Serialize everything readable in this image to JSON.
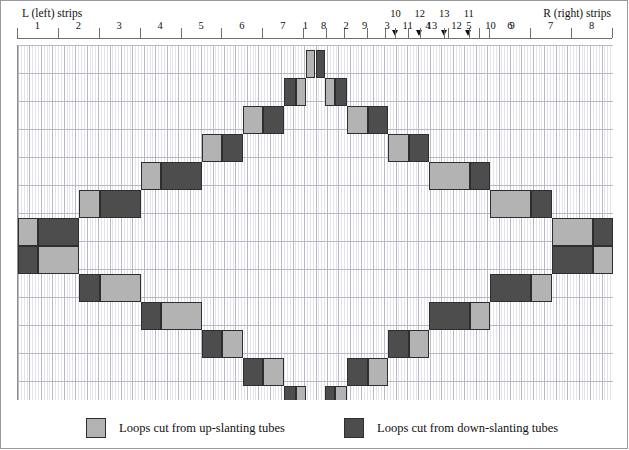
{
  "header": {
    "left_label": "L (left) strips",
    "right_label": "R (right) strips"
  },
  "colors": {
    "up_slanting": "#b3b3b3",
    "down_slanting": "#4d4d4d",
    "grid_minor": "#e3e3ec",
    "grid_major": "#b9b9c6",
    "frame": "#9a9a9a",
    "block_border": "#2e2e2e",
    "background": "#ffffff"
  },
  "legend": {
    "up": {
      "label": "Loops cut from up-slanting tubes",
      "swatch": "#b3b3b3"
    },
    "down": {
      "label": "Loops cut from down-slanting tubes",
      "swatch": "#4d4d4d"
    }
  },
  "ruler": {
    "left_numbers": [
      "1",
      "2",
      "3",
      "4",
      "5",
      "6",
      "7",
      "8",
      "9"
    ],
    "left_inner_upper": [
      "10",
      "12",
      "13",
      "11"
    ],
    "left_inner_lower": [
      "11",
      "13",
      "12"
    ],
    "right_inner_lower": [
      "10",
      "9"
    ],
    "right_numbers": [
      "8",
      "7",
      "6",
      "5",
      "4",
      "3",
      "2",
      "1"
    ],
    "arrow_count": 4,
    "all_labels_left_to_right": [
      "1",
      "2",
      "3",
      "4",
      "5",
      "6",
      "7",
      "8",
      "9",
      "10",
      "11",
      "12",
      "13",
      "13",
      "12",
      "11",
      "10",
      "9",
      "8",
      "7",
      "6",
      "5",
      "4",
      "3",
      "2",
      "1"
    ]
  },
  "chart_data": {
    "type": "diagram",
    "grid": {
      "columns": 52,
      "rows": 13,
      "minor_per_major": 4
    },
    "blocks": [
      {
        "x": 0,
        "y": 7,
        "w": 1,
        "c": "up"
      },
      {
        "x": 1,
        "y": 7,
        "w": 2,
        "c": "down"
      },
      {
        "x": 3,
        "y": 6,
        "w": 1,
        "c": "up"
      },
      {
        "x": 4,
        "y": 6,
        "w": 2,
        "c": "down"
      },
      {
        "x": 6,
        "y": 5,
        "w": 1,
        "c": "up"
      },
      {
        "x": 7,
        "y": 5,
        "w": 2,
        "c": "down"
      },
      {
        "x": 9,
        "y": 4,
        "w": 1,
        "c": "up"
      },
      {
        "x": 10,
        "y": 4,
        "w": 1,
        "c": "down"
      },
      {
        "x": 11,
        "y": 3,
        "w": 1,
        "c": "up"
      },
      {
        "x": 12,
        "y": 3,
        "w": 1,
        "c": "down"
      },
      {
        "x": 13,
        "y": 2,
        "w": 0.6,
        "c": "down"
      },
      {
        "x": 13.6,
        "y": 2,
        "w": 0.5,
        "c": "up"
      },
      {
        "x": 14.1,
        "y": 1,
        "w": 0.45,
        "c": "up"
      },
      {
        "x": 14.55,
        "y": 1,
        "w": 0.45,
        "c": "down"
      },
      {
        "x": 15,
        "y": 2,
        "w": 0.5,
        "c": "up"
      },
      {
        "x": 15.5,
        "y": 2,
        "w": 0.6,
        "c": "down"
      },
      {
        "x": 16.1,
        "y": 3,
        "w": 1,
        "c": "up"
      },
      {
        "x": 17.1,
        "y": 3,
        "w": 1,
        "c": "down"
      },
      {
        "x": 18.1,
        "y": 4,
        "w": 1,
        "c": "up"
      },
      {
        "x": 19.1,
        "y": 4,
        "w": 1,
        "c": "down"
      },
      {
        "x": 20.1,
        "y": 5,
        "w": 2,
        "c": "up"
      },
      {
        "x": 22.1,
        "y": 5,
        "w": 1,
        "c": "down"
      },
      {
        "x": 23.1,
        "y": 6,
        "w": 2,
        "c": "up"
      },
      {
        "x": 25.1,
        "y": 6,
        "w": 1,
        "c": "down"
      },
      {
        "x": 26.1,
        "y": 7,
        "w": 2,
        "c": "up"
      },
      {
        "x": 28.1,
        "y": 7,
        "w": 1,
        "c": "down"
      }
    ],
    "blocks_lower": [
      {
        "x": 0,
        "y": 8,
        "w": 1,
        "c": "down"
      },
      {
        "x": 1,
        "y": 8,
        "w": 2,
        "c": "up"
      },
      {
        "x": 3,
        "y": 9,
        "w": 1,
        "c": "down"
      },
      {
        "x": 4,
        "y": 9,
        "w": 2,
        "c": "up"
      },
      {
        "x": 6,
        "y": 10,
        "w": 1,
        "c": "down"
      },
      {
        "x": 7,
        "y": 10,
        "w": 2,
        "c": "up"
      },
      {
        "x": 9,
        "y": 11,
        "w": 1,
        "c": "down"
      },
      {
        "x": 10,
        "y": 11,
        "w": 1,
        "c": "up"
      },
      {
        "x": 11,
        "y": 12,
        "w": 1,
        "c": "down"
      },
      {
        "x": 12,
        "y": 12,
        "w": 1,
        "c": "up"
      },
      {
        "x": 13,
        "y": 13,
        "w": 0.6,
        "c": "down"
      },
      {
        "x": 13.6,
        "y": 13,
        "w": 0.5,
        "c": "up"
      },
      {
        "x": 14.1,
        "y": 14,
        "w": 0.45,
        "c": "down"
      },
      {
        "x": 14.55,
        "y": 14,
        "w": 0.45,
        "c": "up"
      },
      {
        "x": 15,
        "y": 13,
        "w": 0.5,
        "c": "down"
      },
      {
        "x": 15.5,
        "y": 13,
        "w": 0.6,
        "c": "up"
      },
      {
        "x": 16.1,
        "y": 12,
        "w": 1,
        "c": "down"
      },
      {
        "x": 17.1,
        "y": 12,
        "w": 1,
        "c": "up"
      },
      {
        "x": 18.1,
        "y": 11,
        "w": 1,
        "c": "down"
      },
      {
        "x": 19.1,
        "y": 11,
        "w": 1,
        "c": "up"
      },
      {
        "x": 20.1,
        "y": 10,
        "w": 2,
        "c": "down"
      },
      {
        "x": 22.1,
        "y": 10,
        "w": 1,
        "c": "up"
      },
      {
        "x": 23.1,
        "y": 9,
        "w": 2,
        "c": "down"
      },
      {
        "x": 25.1,
        "y": 9,
        "w": 1,
        "c": "up"
      },
      {
        "x": 26.1,
        "y": 8,
        "w": 2,
        "c": "down"
      },
      {
        "x": 28.1,
        "y": 8,
        "w": 1,
        "c": "up"
      }
    ]
  }
}
